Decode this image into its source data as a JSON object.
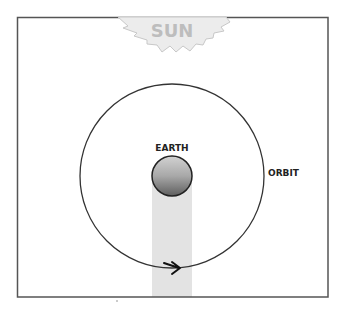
{
  "diagram": {
    "sun": {
      "label": "SUN",
      "color": "#d8d8d8",
      "text_color": "#bdbdbd"
    },
    "earth": {
      "label": "EARTH",
      "color_top": "#c8c8c8",
      "color_bottom": "#6a6a6a"
    },
    "orbit": {
      "label": "ORBIT",
      "direction": "counterclockwise-arrow-right-at-bottom"
    },
    "shadow_color": "#e3e3e3",
    "frame_color": "#555555"
  }
}
